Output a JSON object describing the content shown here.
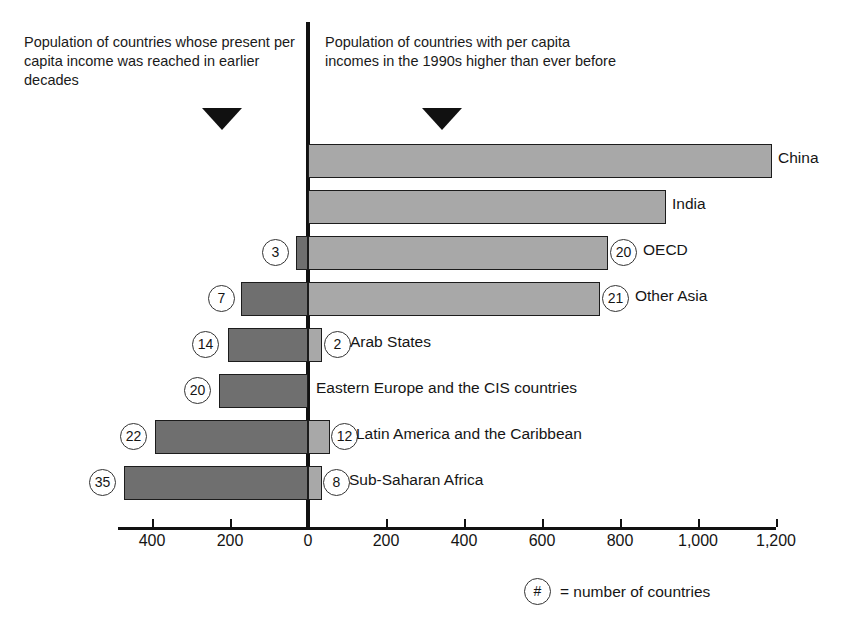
{
  "captions": {
    "left": "Population of countries whose present per capita income was reached in earlier decades",
    "right": "Population of countries with per capita incomes in the 1990s higher than ever before"
  },
  "legend": {
    "symbol": "#",
    "text": "= number of countries"
  },
  "axis": {
    "tick_labels": [
      "400",
      "200",
      "0",
      "200",
      "400",
      "600",
      "800",
      "1,000",
      "1,200"
    ]
  },
  "chart_data": {
    "type": "bar",
    "orientation": "horizontal",
    "subtype": "diverging-bidirectional",
    "title": "",
    "xlabel": "",
    "ylabel": "",
    "xlim": [
      -500,
      1200
    ],
    "grid": false,
    "legend_position": "bottom-right",
    "units": "millions of people",
    "axis_ticks": [
      -400,
      -200,
      0,
      200,
      400,
      600,
      800,
      1000,
      1200
    ],
    "categories": [
      "China",
      "India",
      "OECD",
      "Other Asia",
      "Arab States",
      "Eastern Europe and the CIS countries",
      "Latin America and the Caribbean",
      "Sub-Saharan Africa"
    ],
    "series": [
      {
        "name": "Population of countries with per capita incomes in the 1990s higher than ever before",
        "side": "right",
        "color": "#a8a8a8",
        "values": [
          1190,
          918,
          770,
          750,
          36,
          0,
          57,
          36
        ]
      },
      {
        "name": "Population of countries whose present per capita income was reached in earlier decades",
        "side": "left",
        "color": "#6f6f6f",
        "values": [
          0,
          0,
          30,
          172,
          205,
          228,
          392,
          472
        ]
      }
    ],
    "country_counts_right": [
      null,
      null,
      20,
      21,
      2,
      null,
      12,
      8
    ],
    "country_counts_left": [
      null,
      null,
      3,
      7,
      14,
      20,
      22,
      35
    ]
  },
  "rows": [
    {
      "label": "China",
      "right_badge": "",
      "left_badge": "",
      "r_start": 308,
      "r_end": 772,
      "l_start": 0,
      "l_end": 0,
      "label_x": 778,
      "rb_x": 0,
      "lb_x": 0
    },
    {
      "label": "India",
      "right_badge": "",
      "left_badge": "",
      "r_start": 308,
      "r_end": 666,
      "l_start": 0,
      "l_end": 0,
      "label_x": 672,
      "rb_x": 0,
      "lb_x": 0
    },
    {
      "label": "OECD",
      "right_badge": "20",
      "left_badge": "3",
      "r_start": 308,
      "r_end": 608,
      "l_start": 296,
      "l_end": 308,
      "label_x": 643,
      "rb_x": 610,
      "lb_x": 262
    },
    {
      "label": "Other Asia",
      "right_badge": "21",
      "left_badge": "7",
      "r_start": 308,
      "r_end": 600,
      "l_start": 241,
      "l_end": 308,
      "label_x": 635,
      "rb_x": 602,
      "lb_x": 208
    },
    {
      "label": "Arab States",
      "right_badge": "2",
      "left_badge": "14",
      "r_start": 308,
      "r_end": 322,
      "l_start": 228,
      "l_end": 308,
      "label_x": 350,
      "rb_x": 324,
      "lb_x": 192
    },
    {
      "label": "Eastern Europe and the CIS countries",
      "right_badge": "",
      "left_badge": "20",
      "r_start": 0,
      "r_end": 0,
      "l_start": 219,
      "l_end": 308,
      "label_x": 316,
      "rb_x": 0,
      "lb_x": 184
    },
    {
      "label": "Latin America and the Caribbean",
      "right_badge": "12",
      "left_badge": "22",
      "r_start": 308,
      "r_end": 330,
      "l_start": 155,
      "l_end": 308,
      "label_x": 356,
      "rb_x": 331,
      "lb_x": 120
    },
    {
      "label": "Sub-Saharan Africa",
      "right_badge": "8",
      "left_badge": "35",
      "r_start": 308,
      "r_end": 322,
      "l_start": 124,
      "l_end": 308,
      "label_x": 349,
      "rb_x": 323,
      "lb_x": 89
    }
  ],
  "axis_px": {
    "left": 118,
    "width": 658,
    "ticks": [
      152,
      230,
      308,
      386,
      464,
      542,
      620,
      698,
      776
    ]
  }
}
